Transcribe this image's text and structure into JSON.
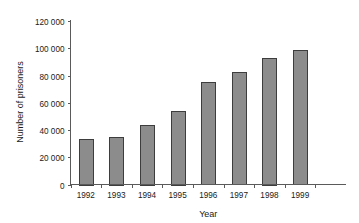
{
  "chart_data": {
    "type": "bar",
    "title": "",
    "subtitle": "",
    "xlabel": "Year",
    "ylabel": "Number of prisoners",
    "categories": [
      "1992",
      "1993",
      "1994",
      "1995",
      "1996",
      "1997",
      "1998",
      "1999"
    ],
    "values": [
      33500,
      35000,
      44000,
      54000,
      75000,
      82500,
      93000,
      98500
    ],
    "series": [
      {
        "name": "Number of prisoners",
        "values": [
          33500,
          35000,
          44000,
          54000,
          75000,
          82500,
          93000,
          98500
        ]
      }
    ],
    "ylim": [
      0,
      120000
    ],
    "ytick_values": [
      0,
      20000,
      40000,
      60000,
      80000,
      100000,
      120000
    ],
    "ytick_labels": [
      "0",
      "20 000",
      "40 000",
      "60 000",
      "80 000",
      "100 000",
      "120 000"
    ],
    "grid": false,
    "legend": null,
    "legend_position": "none",
    "bar_color": "#8c8c8c",
    "bar_edge_color": "#3d3d3d",
    "axis_color": "#5a5a5a",
    "background_color": "#ffffff"
  }
}
